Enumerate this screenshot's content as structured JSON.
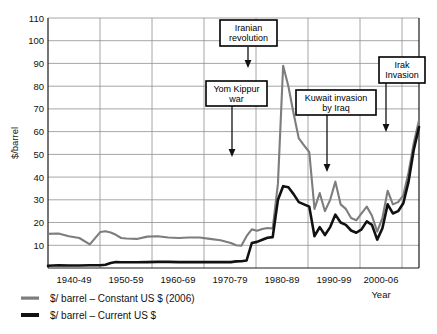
{
  "chart_data": {
    "type": "line",
    "title": "",
    "xlabel": "Year",
    "ylabel": "$/barrel",
    "ylim": [
      0,
      110
    ],
    "ytick_step": 10,
    "yticks": [
      "10",
      "20",
      "30",
      "40",
      "50",
      "60",
      "70",
      "80",
      "90",
      "100",
      "110"
    ],
    "categories": [
      "1940-49",
      "1950-59",
      "1960-69",
      "1970-79",
      "1980-89",
      "1990-99",
      "2000-06"
    ],
    "xlim": [
      1935,
      2006
    ],
    "grid": "horizontal-and-vertical",
    "legend_position": "below-plot-left",
    "series": [
      {
        "name": "$/ barrel – Constant US $ (2006)",
        "color": "#7d7d7d",
        "x": [
          1935,
          1937,
          1939,
          1941,
          1943,
          1945,
          1946,
          1947,
          1948,
          1949,
          1950,
          1952,
          1954,
          1956,
          1958,
          1960,
          1962,
          1964,
          1966,
          1968,
          1970,
          1971,
          1972,
          1973,
          1974,
          1975,
          1976,
          1977,
          1978,
          1979,
          1980,
          1981,
          1982,
          1983,
          1984,
          1985,
          1986,
          1987,
          1988,
          1989,
          1990,
          1991,
          1992,
          1993,
          1994,
          1995,
          1996,
          1997,
          1998,
          1999,
          2000,
          2001,
          2002,
          2003,
          2004,
          2005,
          2006
        ],
        "values": [
          15.0,
          15.2,
          14.0,
          13.2,
          10.4,
          15.8,
          16.2,
          15.6,
          14.6,
          13.2,
          13.0,
          12.8,
          13.8,
          14.0,
          13.4,
          13.2,
          13.4,
          13.4,
          12.8,
          12.2,
          11.0,
          10.0,
          9.8,
          14.0,
          17.0,
          16.4,
          17.2,
          17.6,
          17.4,
          37.0,
          89.0,
          80.0,
          68.0,
          57.0,
          54.0,
          51.0,
          26.0,
          33.0,
          25.0,
          30.0,
          38.0,
          28.0,
          26.0,
          22.0,
          21.0,
          24.0,
          27.0,
          23.0,
          16.0,
          22.0,
          34.0,
          28.0,
          29.0,
          32.0,
          42.0,
          55.0,
          65.0
        ]
      },
      {
        "name": "$/ barrel – Current US $",
        "color": "#111111",
        "x": [
          1935,
          1937,
          1939,
          1941,
          1943,
          1945,
          1946,
          1947,
          1948,
          1949,
          1950,
          1952,
          1954,
          1956,
          1958,
          1960,
          1962,
          1964,
          1966,
          1968,
          1970,
          1971,
          1972,
          1973,
          1974,
          1975,
          1976,
          1977,
          1978,
          1979,
          1980,
          1981,
          1982,
          1983,
          1984,
          1985,
          1986,
          1987,
          1988,
          1989,
          1990,
          1991,
          1992,
          1993,
          1994,
          1995,
          1996,
          1997,
          1998,
          1999,
          2000,
          2001,
          2002,
          2003,
          2004,
          2005,
          2006
        ],
        "values": [
          1.0,
          1.2,
          1.1,
          1.1,
          1.2,
          1.2,
          1.4,
          2.2,
          2.6,
          2.5,
          2.5,
          2.5,
          2.6,
          2.7,
          2.7,
          2.6,
          2.6,
          2.6,
          2.6,
          2.6,
          2.6,
          2.9,
          3.0,
          3.3,
          11.0,
          11.5,
          12.4,
          13.3,
          13.6,
          30.0,
          36.0,
          35.5,
          32.5,
          29.0,
          28.0,
          27.0,
          14.0,
          18.0,
          14.5,
          18.0,
          23.5,
          20.0,
          19.0,
          16.5,
          15.5,
          17.0,
          20.5,
          19.0,
          12.5,
          17.5,
          28.0,
          24.0,
          25.0,
          28.5,
          38.0,
          52.0,
          62.0
        ]
      }
    ],
    "annotations": [
      {
        "id": "yom-kippur",
        "label_lines": [
          "Yom Kippur",
          "war"
        ],
        "year": 1973,
        "arrow": "down"
      },
      {
        "id": "iranian-revolution",
        "label_lines": [
          "Iranian",
          "revolution"
        ],
        "year": 1979,
        "arrow": "down"
      },
      {
        "id": "kuwait-invasion",
        "label_lines": [
          "Kuwait invasion",
          "by Iraq"
        ],
        "year": 1990,
        "arrow": "down"
      },
      {
        "id": "irak-invasion",
        "label_lines": [
          "Irak",
          "Invasion"
        ],
        "year": 2003,
        "arrow": "down"
      }
    ]
  },
  "axes": {
    "y_title": "$/barrel",
    "x_title": "Year",
    "y_ticks": [
      {
        "value": "110"
      },
      {
        "value": "100"
      },
      {
        "value": "90"
      },
      {
        "value": "80"
      },
      {
        "value": "70"
      },
      {
        "value": "60"
      },
      {
        "value": "50"
      },
      {
        "value": "40"
      },
      {
        "value": "30"
      },
      {
        "value": "20"
      },
      {
        "value": "10"
      }
    ],
    "x_ticks": [
      {
        "value": "1940-49"
      },
      {
        "value": "1950-59"
      },
      {
        "value": "1960-69"
      },
      {
        "value": "1970-79"
      },
      {
        "value": "1980-89"
      },
      {
        "value": "1990-99"
      },
      {
        "value": "2000-06"
      }
    ]
  },
  "legend": {
    "items": [
      {
        "label": "$/ barrel – Constant US $ (2006)",
        "color": "#7d7d7d"
      },
      {
        "label": "$/ barrel – Current US $",
        "color": "#111111"
      }
    ]
  },
  "annotation_labels": {
    "yom_kippur_line1": "Yom Kippur",
    "yom_kippur_line2": "war",
    "iranian_line1": "Iranian",
    "iranian_line2": "revolution",
    "kuwait_line1": "Kuwait invasion",
    "kuwait_line2": "by Iraq",
    "irak_line1": "Irak",
    "irak_line2": "Invasion"
  },
  "colors": {
    "constant_series": "#7d7d7d",
    "current_series": "#111111",
    "grid": "#8f8f8f",
    "frame": "#1a1a1a",
    "background": "#ffffff"
  }
}
